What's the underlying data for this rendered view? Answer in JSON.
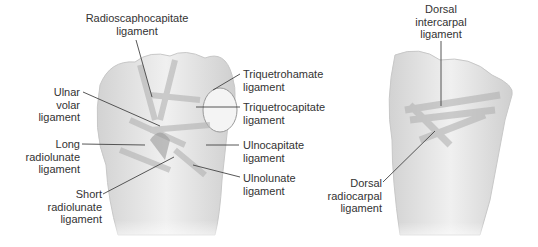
{
  "figure": {
    "left_view": "palmar (volar) wrist ligaments",
    "right_view": "dorsal wrist ligaments"
  },
  "labels": {
    "radioscaphocapitate": "Radioscaphocapitate\nligament",
    "ulnar_volar": "Ulnar\nvolar\nligament",
    "long_radiolunate": "Long\nradiolunate\nligament",
    "short_radiolunate": "Short\nradiolunate\nligament",
    "triquetrohamate": "Triquetrohamate\nligament",
    "triquetrocapitate": "Triquetrocapitate\nligament",
    "ulnocapitate": "Ulnocapitate\nligament",
    "ulnolunate": "Ulnolunate\nligament",
    "dorsal_intercarpal": "Dorsal\nintercarpal\nligament",
    "dorsal_radiocarpal": "Dorsal\nradiocarpal\nligament"
  },
  "colors": {
    "bone": "#e6e6e6",
    "shade": "#bdbdbd",
    "line": "#444444",
    "text": "#333333"
  }
}
